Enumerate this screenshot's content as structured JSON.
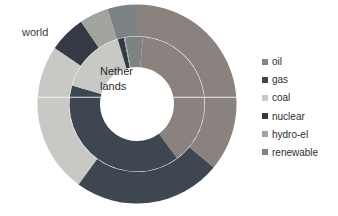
{
  "chart": {
    "world_label": "world",
    "inner_label_line1": "Nether",
    "inner_label_line2": "lands"
  },
  "legend": {
    "items": [
      {
        "label": "oil",
        "color": "#8a827e"
      },
      {
        "label": "gas",
        "color": "#3e4652"
      },
      {
        "label": "coal",
        "color": "#c8c8c5"
      },
      {
        "label": "nuclear",
        "color": "#343a44"
      },
      {
        "label": "hydro-el",
        "color": "#a2a59e"
      },
      {
        "label": "renewable",
        "color": "#7d8285"
      }
    ]
  },
  "chart_data": {
    "type": "pie",
    "subtype": "nested-donut",
    "unit": "percent",
    "legend_position": "right",
    "categories": [
      "oil",
      "gas",
      "coal",
      "nuclear",
      "hydro-el",
      "renewable"
    ],
    "series": [
      {
        "name": "world",
        "ring": "outer",
        "start_angle": 0,
        "values": [
          36.0,
          24.0,
          24.5,
          6.0,
          4.7,
          4.8
        ]
      },
      {
        "name": "Netherlands",
        "ring": "inner",
        "start_angle": 5,
        "values": [
          38.5,
          39.5,
          16.0,
          1.5,
          0.3,
          4.2
        ]
      }
    ]
  }
}
